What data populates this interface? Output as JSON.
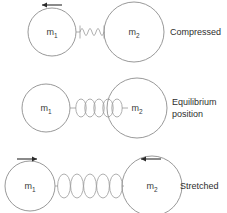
{
  "diagram": {
    "colors": {
      "background": "#ffffff",
      "circle_stroke": "#8d8d8d",
      "spring_stroke": "#9a9a9a",
      "arrow": "#2a2a2a",
      "text": "#2e2e2e"
    },
    "rows": [
      {
        "id": "compressed",
        "state_label": "Compressed",
        "state_label_lines": [
          "Compressed"
        ],
        "left_mass": "m",
        "left_mass_sub": "1",
        "right_mass": "m",
        "right_mass_sub": "2",
        "spring_coils": 6,
        "spring_state": "compressed",
        "arrows": [
          {
            "name": "left-arrow",
            "direction": "left",
            "over": "m1"
          }
        ]
      },
      {
        "id": "equilibrium",
        "state_label": "Equilibrium position",
        "state_label_lines": [
          "Equilibrium",
          "position"
        ],
        "left_mass": "m",
        "left_mass_sub": "1",
        "right_mass": "m",
        "right_mass_sub": "2",
        "spring_coils": 5,
        "spring_state": "equilibrium",
        "arrows": []
      },
      {
        "id": "stretched",
        "state_label": "Stretched",
        "state_label_lines": [
          "Stretched"
        ],
        "left_mass": "m",
        "left_mass_sub": "1",
        "right_mass": "m",
        "right_mass_sub": "2",
        "spring_coils": 5,
        "spring_state": "stretched",
        "arrows": [
          {
            "name": "left-arrow",
            "direction": "right",
            "over": "m1"
          },
          {
            "name": "right-arrow",
            "direction": "left",
            "over": "m2"
          }
        ]
      }
    ]
  }
}
